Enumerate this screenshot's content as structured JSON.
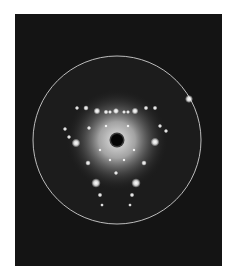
{
  "image": {
    "subject": "electron diffraction pattern",
    "description": "Hexagonal-symmetry diffraction spot pattern with central beam stop, diffuse bright halo and circular screen edge on dark background",
    "colors": {
      "page_background": "#ffffff",
      "frame_background": "#141414",
      "screen_ring": "#cfcfcf",
      "spot": "#ffffff",
      "halo_center": "#e8e8e8"
    },
    "frame": {
      "x": 15,
      "y": 14,
      "width": 207,
      "height": 252
    },
    "screen": {
      "cx": 117,
      "cy": 140,
      "r": 84
    },
    "beam_stop": {
      "cx": 117,
      "cy": 140,
      "r": 6
    },
    "glint": {
      "cx": 189,
      "cy": 99,
      "r": 2.5
    },
    "spots": [
      {
        "cx": 77,
        "cy": 108,
        "r": 1.3
      },
      {
        "cx": 86,
        "cy": 108,
        "r": 1.6
      },
      {
        "cx": 97,
        "cy": 111,
        "r": 2.0
      },
      {
        "cx": 106,
        "cy": 112,
        "r": 1.4
      },
      {
        "cx": 110,
        "cy": 112,
        "r": 1.2
      },
      {
        "cx": 116,
        "cy": 111,
        "r": 1.8
      },
      {
        "cx": 124,
        "cy": 112,
        "r": 1.2
      },
      {
        "cx": 128,
        "cy": 112,
        "r": 1.2
      },
      {
        "cx": 135,
        "cy": 111,
        "r": 2.0
      },
      {
        "cx": 146,
        "cy": 108,
        "r": 1.4
      },
      {
        "cx": 155,
        "cy": 108,
        "r": 1.4
      },
      {
        "cx": 65,
        "cy": 129,
        "r": 1.3
      },
      {
        "cx": 69,
        "cy": 137,
        "r": 1.3
      },
      {
        "cx": 89,
        "cy": 128,
        "r": 1.3
      },
      {
        "cx": 160,
        "cy": 126,
        "r": 1.3
      },
      {
        "cx": 166,
        "cy": 131,
        "r": 1.3
      },
      {
        "cx": 76,
        "cy": 143,
        "r": 2.6
      },
      {
        "cx": 155,
        "cy": 142,
        "r": 2.6
      },
      {
        "cx": 88,
        "cy": 163,
        "r": 1.6
      },
      {
        "cx": 144,
        "cy": 163,
        "r": 1.6
      },
      {
        "cx": 96,
        "cy": 183,
        "r": 2.8
      },
      {
        "cx": 136,
        "cy": 183,
        "r": 2.8
      },
      {
        "cx": 116,
        "cy": 173,
        "r": 1.3
      },
      {
        "cx": 100,
        "cy": 195,
        "r": 1.4
      },
      {
        "cx": 132,
        "cy": 195,
        "r": 1.4
      },
      {
        "cx": 102,
        "cy": 205,
        "r": 1.1
      },
      {
        "cx": 130,
        "cy": 205,
        "r": 1.1
      },
      {
        "cx": 110,
        "cy": 160,
        "r": 1.0
      },
      {
        "cx": 124,
        "cy": 160,
        "r": 1.0
      },
      {
        "cx": 100,
        "cy": 150,
        "r": 1.0
      },
      {
        "cx": 134,
        "cy": 150,
        "r": 1.0
      },
      {
        "cx": 106,
        "cy": 126,
        "r": 1.0
      },
      {
        "cx": 128,
        "cy": 126,
        "r": 1.0
      }
    ]
  }
}
